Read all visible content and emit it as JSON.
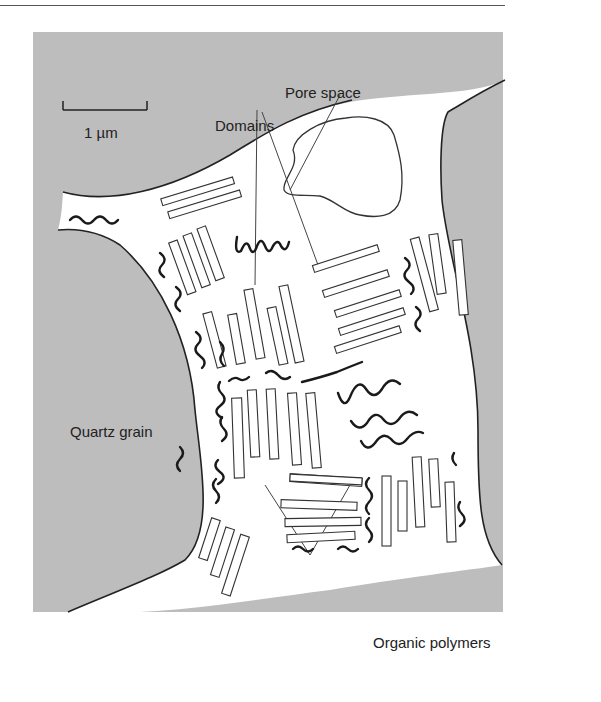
{
  "figure": {
    "background_color": "#bdbdbd",
    "matrix_color": "#ffffff",
    "stroke_color": "#222222",
    "scale_bar": {
      "label": "1 µm"
    },
    "labels": {
      "pore_space": "Pore space",
      "domains": "Domains",
      "quartz_grain": "Quartz grain",
      "organic_polymers": "Organic polymers"
    }
  }
}
